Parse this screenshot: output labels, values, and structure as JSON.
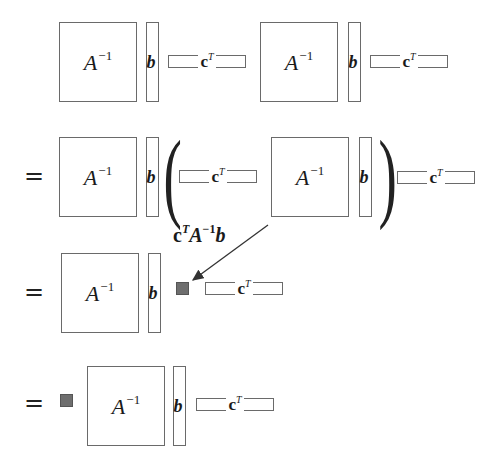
{
  "diagram": {
    "title": "",
    "colors": {
      "stroke": "#6a6a6a",
      "scalar_fill": "#6e6e6e",
      "text": "#1a1a1a"
    },
    "symbols": {
      "matrix_inverse_base": "A",
      "matrix_inverse_exp": "−1",
      "column_vector": "b",
      "row_vector_base": "c",
      "row_vector_exp": "T",
      "equals": "=",
      "left_paren": "(",
      "right_paren": ")"
    },
    "rows": [
      {
        "id": "row-1",
        "prefix": "",
        "terms": [
          "A^-1",
          "b",
          "c^T",
          "A^-1",
          "b",
          "c^T"
        ]
      },
      {
        "id": "row-2",
        "prefix": "=",
        "terms": [
          "A^-1",
          "b",
          "(",
          "c^T",
          "A^-1",
          "b",
          ")",
          "c^T"
        ]
      },
      {
        "id": "row-3",
        "prefix": "=",
        "terms": [
          "A^-1",
          "b",
          "scalar",
          "c^T"
        ]
      },
      {
        "id": "row-4",
        "prefix": "=",
        "terms": [
          "scalar",
          "A^-1",
          "b",
          "c^T"
        ]
      }
    ],
    "annotation": {
      "c": "c",
      "c_exp": "T",
      "A": "A",
      "A_exp": "−1",
      "b": "b",
      "description": "arrow points from the parenthesized product to the scalar square"
    }
  }
}
